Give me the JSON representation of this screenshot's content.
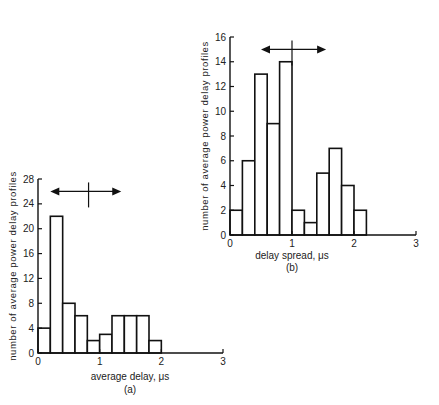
{
  "chart_data": [
    {
      "type": "bar",
      "panel": "(a)",
      "title": "",
      "xlabel": "average delay, μs",
      "ylabel": "number of average power delay profiles",
      "bin_width": 0.2,
      "bin_starts": [
        0,
        0.2,
        0.4,
        0.6,
        0.8,
        1.0,
        1.2,
        1.4,
        1.6,
        1.8
      ],
      "values": [
        4,
        22,
        8,
        6,
        2,
        3,
        6,
        6,
        6,
        2
      ],
      "xlim": [
        0,
        3
      ],
      "ylim": [
        0,
        28
      ],
      "x_ticks": [
        "0",
        "1",
        "2",
        "3"
      ],
      "y_ticks": [
        "0",
        "4",
        "8",
        "12",
        "16",
        "20",
        "24",
        "28"
      ],
      "annotation": {
        "type": "double-arrow",
        "from": 0.2,
        "to": 1.35,
        "marker": 0.82,
        "y": 26
      },
      "grid": false,
      "caption": "(a)"
    },
    {
      "type": "bar",
      "panel": "(b)",
      "title": "",
      "xlabel": "delay spread, μs",
      "ylabel": "number of average power delay profiles",
      "bin_width": 0.2,
      "bin_starts": [
        0,
        0.2,
        0.4,
        0.6,
        0.8,
        1.0,
        1.2,
        1.4,
        1.6,
        1.8,
        2.0
      ],
      "values": [
        2,
        6,
        13,
        9,
        14,
        2,
        1,
        5,
        7,
        4,
        2
      ],
      "xlim": [
        0,
        3
      ],
      "ylim": [
        0,
        16
      ],
      "x_ticks": [
        "0",
        "1",
        "2",
        "3"
      ],
      "y_ticks": [
        "0",
        "2",
        "4",
        "6",
        "8",
        "10",
        "12",
        "14",
        "16"
      ],
      "annotation": {
        "type": "double-arrow",
        "from": 0.5,
        "to": 1.55,
        "marker": 1.0,
        "y": 15
      },
      "grid": false,
      "caption": "(b)"
    }
  ]
}
